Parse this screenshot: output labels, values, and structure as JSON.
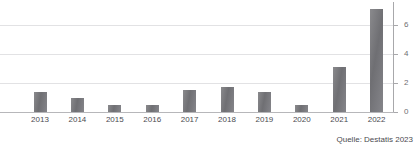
{
  "chart_data": {
    "type": "bar",
    "title": "",
    "subtitle": "",
    "xlabel": "",
    "ylabel": "",
    "categories": [
      "2013",
      "2014",
      "2015",
      "2016",
      "2017",
      "2018",
      "2019",
      "2020",
      "2021",
      "2022"
    ],
    "values": [
      1.4,
      0.95,
      0.5,
      0.5,
      1.5,
      1.7,
      1.4,
      0.45,
      3.1,
      7.1
    ],
    "ylim": [
      0,
      7.4
    ],
    "yticks": [
      0,
      2,
      4,
      6
    ],
    "ytick_labels": [
      "0",
      "2",
      "4",
      "6"
    ],
    "grid": true,
    "y_axis_position": "right",
    "legend": "none",
    "bar_color": "#77777b",
    "gridline_color": "#e2e2e4",
    "axis_color": "#a8a8ab",
    "text_color": "#4b4b50"
  },
  "footer": {
    "source": "Quelle: Destatis 2023"
  },
  "header": {
    "cropped_title": ""
  }
}
